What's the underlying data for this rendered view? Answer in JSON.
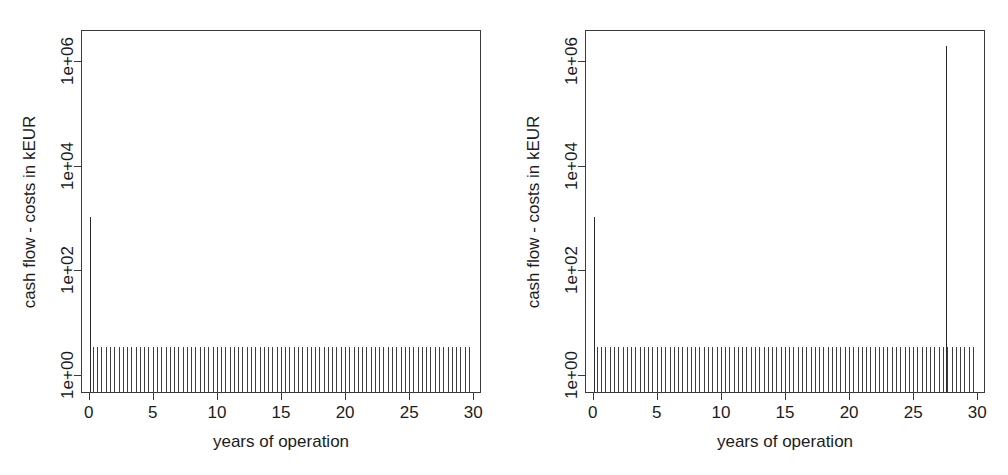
{
  "figure": {
    "background": "#ffffff",
    "line_color": "#3a3a3a",
    "text_color": "#1c1c1c"
  },
  "chart_data": [
    {
      "type": "bar",
      "panel": "left",
      "title": "",
      "xlabel": "years of operation",
      "ylabel": "cash flow - costs in kEUR",
      "xlim": [
        -0.6,
        30.6
      ],
      "ylim_log10": [
        -0.35,
        6.6
      ],
      "yscale": "log",
      "grid": false,
      "legend": null,
      "xticks": [
        0,
        5,
        10,
        15,
        20,
        25,
        30
      ],
      "xticklabels": [
        "0",
        "5",
        "10",
        "15",
        "20",
        "25",
        "30"
      ],
      "yticks": [
        1,
        100,
        10000,
        1000000
      ],
      "yticklabels": [
        "1e+00",
        "1e+02",
        "1e+04",
        "1e+06"
      ],
      "annotations": [
        "initial investment spike at year 0 reaching about 1e+03 kEUR",
        "recurring operating cash flow bars of about 3 kEUR across all 30 years"
      ],
      "series": [
        {
          "name": "initial investment",
          "x": [
            0
          ],
          "values": [
            1000
          ]
        },
        {
          "name": "recurring cash flow",
          "x_start": 0.25,
          "x_end": 29.75,
          "x_step": 0.3333,
          "value": 3.2
        }
      ]
    },
    {
      "type": "bar",
      "panel": "right",
      "title": "",
      "xlabel": "years of operation",
      "ylabel": "cash flow - costs in kEUR",
      "xlim": [
        -0.6,
        30.6
      ],
      "ylim_log10": [
        -0.35,
        6.6
      ],
      "yscale": "log",
      "grid": false,
      "legend": null,
      "xticks": [
        0,
        5,
        10,
        15,
        20,
        25,
        30
      ],
      "xticklabels": [
        "0",
        "5",
        "10",
        "15",
        "20",
        "25",
        "30"
      ],
      "yticks": [
        1,
        100,
        10000,
        1000000
      ],
      "yticklabels": [
        "1e+00",
        "1e+02",
        "1e+04",
        "1e+06"
      ],
      "annotations": [
        "initial investment spike at year 0 reaching about 1e+03 kEUR",
        "large decommissioning spike at about year 27.5 reaching about 2e+06 kEUR",
        "recurring operating cash flow bars of about 3 kEUR across all 30 years"
      ],
      "series": [
        {
          "name": "initial investment",
          "x": [
            0
          ],
          "values": [
            1000
          ]
        },
        {
          "name": "decommissioning",
          "x": [
            27.5
          ],
          "values": [
            1900000
          ]
        },
        {
          "name": "recurring cash flow",
          "x_start": 0.25,
          "x_end": 29.75,
          "x_step": 0.3333,
          "value": 3.2
        }
      ]
    }
  ],
  "panels": [
    {
      "id": "left",
      "y_axis_title": "cash flow - costs in kEUR",
      "x_axis_title": "years of operation",
      "x_tick_labels": [
        "0",
        "5",
        "10",
        "15",
        "20",
        "25",
        "30"
      ],
      "y_tick_labels": [
        "1e+00",
        "1e+02",
        "1e+04",
        "1e+06"
      ]
    },
    {
      "id": "right",
      "y_axis_title": "cash flow - costs in kEUR",
      "x_axis_title": "years of operation",
      "x_tick_labels": [
        "0",
        "5",
        "10",
        "15",
        "20",
        "25",
        "30"
      ],
      "y_tick_labels": [
        "1e+00",
        "1e+02",
        "1e+04",
        "1e+06"
      ]
    }
  ]
}
